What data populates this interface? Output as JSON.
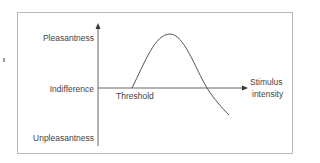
{
  "diagram": {
    "y_axis": {
      "labels": {
        "top": "Pleasantness",
        "middle": "Indifference",
        "bottom": "Unpleasantness"
      }
    },
    "x_axis": {
      "label_line1": "Stimulus",
      "label_line2": "intensity"
    },
    "curve": {
      "annotation": "Threshold",
      "description": "Hedonic curve rising from threshold to a pleasantness peak, then falling below indifference into unpleasantness as stimulus intensity increases"
    },
    "colors": {
      "line": "#555555",
      "frame": "#b8b8b8",
      "text": "#444444"
    }
  }
}
